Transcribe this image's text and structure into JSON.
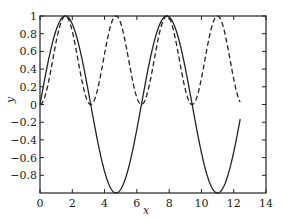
{
  "chart_data": {
    "type": "line",
    "title": "",
    "xlabel": "x",
    "ylabel": "y",
    "xlim": [
      0,
      14
    ],
    "ylim": [
      -1,
      1
    ],
    "grid": false,
    "xticks": [
      0,
      2,
      4,
      6,
      8,
      10,
      12,
      14
    ],
    "xtick_labels": [
      "0",
      "2",
      "4",
      "6",
      "8",
      "10",
      "12",
      "14"
    ],
    "yticks": [
      1,
      0.8,
      0.6,
      0.4,
      0.2,
      0,
      -0.2,
      -0.4,
      -0.6,
      -0.8
    ],
    "ytick_labels": [
      "1",
      "0.8",
      "0.6",
      "0.4",
      "0.2",
      "0",
      "−0.2",
      "−0.4",
      "−0.6",
      "−0.8"
    ],
    "series": [
      {
        "name": "sin(x)",
        "style": "solid",
        "color": "#222222",
        "function": "sin",
        "x_range": [
          0,
          12.4
        ]
      },
      {
        "name": "sin²(x)",
        "style": "dashed",
        "color": "#222222",
        "function": "sin2",
        "x_range": [
          0,
          12.4
        ]
      }
    ]
  }
}
